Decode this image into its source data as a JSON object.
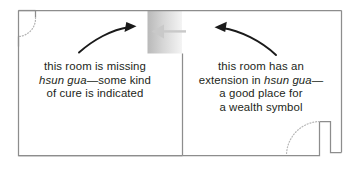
{
  "diagram": {
    "type": "floor-plan",
    "colors": {
      "wall": "#8d8d8d",
      "text": "#231f20",
      "arrow": "#1a1a1a",
      "block_dark": "#bcbcbc",
      "block_light": "#f2f2f2",
      "block_arrow": "#c9c9c9",
      "door_arc": "#bbbbbb"
    },
    "annotations": [
      {
        "name": "left-room-note",
        "lines": [
          {
            "segments": [
              {
                "text": "this room is missing",
                "style": "roman"
              }
            ]
          },
          {
            "segments": [
              {
                "text": "hsun gua",
                "style": "italic"
              },
              {
                "text": "—some kind",
                "style": "roman"
              }
            ]
          },
          {
            "segments": [
              {
                "text": "of cure is indicated",
                "style": "roman"
              }
            ]
          }
        ]
      },
      {
        "name": "right-room-note",
        "lines": [
          {
            "segments": [
              {
                "text": "this room has an",
                "style": "roman"
              }
            ]
          },
          {
            "segments": [
              {
                "text": "extension in ",
                "style": "roman"
              },
              {
                "text": "hsun gua",
                "style": "italic"
              },
              {
                "text": "—",
                "style": "roman"
              }
            ]
          },
          {
            "segments": [
              {
                "text": "a good place for",
                "style": "roman"
              }
            ]
          },
          {
            "segments": [
              {
                "text": "a wealth symbol",
                "style": "roman"
              }
            ]
          }
        ]
      }
    ],
    "elements": {
      "outline_name": "room-outline",
      "gray_block_name": "hsun-gua-block",
      "block_arrow_name": "block-pointer-arrow",
      "left_arrow_name": "left-curved-arrow",
      "right_arrow_name": "right-curved-arrow",
      "door_top_left_name": "door-swing-top-left",
      "door_bottom_right_name": "door-swing-bottom-right"
    }
  }
}
